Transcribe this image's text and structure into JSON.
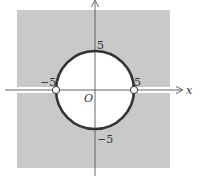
{
  "diagram": {
    "type": "complex-plane-region",
    "colors": {
      "shade": "#c9c9c9",
      "background": "#ffffff",
      "circle": "#333333",
      "axis": "#555555"
    },
    "axes": {
      "x_label": "x",
      "origin_label": "O"
    },
    "circle": {
      "radius_value": 5,
      "center": [
        0,
        0
      ]
    },
    "tick_labels": {
      "top": "5",
      "bottom": "−5",
      "left": "−5",
      "right": "5"
    },
    "open_points": [
      {
        "x": -5,
        "y": 0
      },
      {
        "x": 5,
        "y": 0
      }
    ]
  }
}
